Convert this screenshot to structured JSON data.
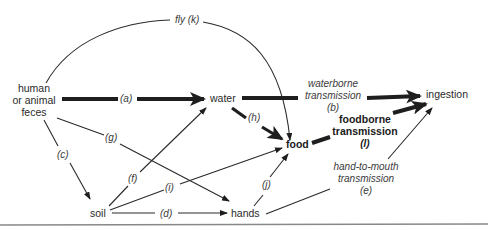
{
  "diagram": {
    "nodes": {
      "feces_line1": "human",
      "feces_line2": "or animal",
      "feces_line3": "feces",
      "water": "water",
      "food": "food",
      "ingestion": "ingestion",
      "soil": "soil",
      "hands": "hands"
    },
    "edges": {
      "a": "(a)",
      "b_line1": "waterborne",
      "b_line2": "transmission",
      "b": "(b)",
      "c": "(c)",
      "d": "(d)",
      "e_line1": "hand-to-mouth",
      "e_line2": "transmission",
      "e": "(e)",
      "f": "(f)",
      "g": "(g)",
      "h": "(h)",
      "i": "(i)",
      "j": "(j)",
      "k": "fly (k)",
      "l_line1": "foodborne",
      "l_line2": "transmission",
      "l": "(l)"
    },
    "colors": {
      "line": "#1e1e1e",
      "text": "#2a2a2a",
      "rule": "#888888"
    }
  }
}
